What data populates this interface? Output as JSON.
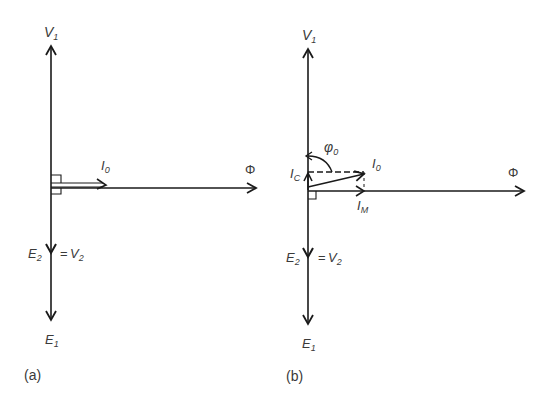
{
  "figure": {
    "panel_a": {
      "caption": "(a)",
      "labels": {
        "v1_main": "V",
        "v1_sub": "1",
        "e1_main": "E",
        "e1_sub": "1",
        "e2_main": "E",
        "e2_sub": "2",
        "eq": "=",
        "v2_main": "V",
        "v2_sub": "2",
        "i0_main": "I",
        "i0_sub": "0",
        "phi": "Φ"
      }
    },
    "panel_b": {
      "caption": "(b)",
      "labels": {
        "v1_main": "V",
        "v1_sub": "1",
        "e1_main": "E",
        "e1_sub": "1",
        "e2_main": "E",
        "e2_sub": "2",
        "eq": "=",
        "v2_main": "V",
        "v2_sub": "2",
        "i0_main": "I",
        "i0_sub": "0",
        "ic_main": "I",
        "ic_sub": "C",
        "im_main": "I",
        "im_sub": "M",
        "phi0_main": "φ",
        "phi0_sub": "0",
        "phi": "Φ"
      }
    },
    "colors": {
      "stroke": "#1a1a1a",
      "text": "#3a3a3a",
      "background": "#ffffff"
    }
  }
}
